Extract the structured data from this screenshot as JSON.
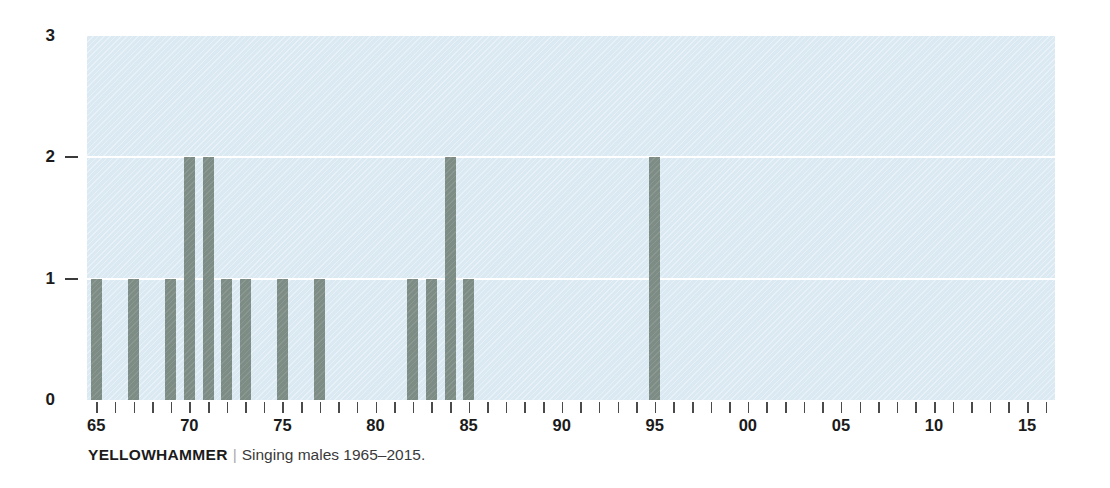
{
  "caption": {
    "species": "YELLOWHAMMER",
    "separator": "|",
    "description": "Singing males 1965–2015."
  },
  "colors": {
    "plot_background": "#dbeaf2",
    "bar": "#7d8c85",
    "gridline": "#ffffff",
    "axis_text": "#1b1b1b",
    "tick": "#4a4a4a",
    "caption_separator": "#a8a8a8"
  },
  "chart_data": {
    "type": "bar",
    "xlabel": "",
    "ylabel": "",
    "grid": true,
    "legend": null,
    "xlim": [
      1964.5,
      2016.5
    ],
    "ylim": [
      0,
      3
    ],
    "y_ticks": [
      0,
      1,
      2,
      3
    ],
    "y_tick_labels": [
      "0",
      "1",
      "2",
      "3"
    ],
    "x_ticks": [
      1965,
      1966,
      1967,
      1968,
      1969,
      1970,
      1971,
      1972,
      1973,
      1974,
      1975,
      1976,
      1977,
      1978,
      1979,
      1980,
      1981,
      1982,
      1983,
      1984,
      1985,
      1986,
      1987,
      1988,
      1989,
      1990,
      1991,
      1992,
      1993,
      1994,
      1995,
      1996,
      1997,
      1998,
      1999,
      2000,
      2001,
      2002,
      2003,
      2004,
      2005,
      2006,
      2007,
      2008,
      2009,
      2010,
      2011,
      2012,
      2013,
      2014,
      2015,
      2016
    ],
    "x_tick_labels": [
      {
        "year": 1965,
        "label": "65"
      },
      {
        "year": 1970,
        "label": "70"
      },
      {
        "year": 1975,
        "label": "75"
      },
      {
        "year": 1980,
        "label": "80"
      },
      {
        "year": 1985,
        "label": "85"
      },
      {
        "year": 1990,
        "label": "90"
      },
      {
        "year": 1995,
        "label": "95"
      },
      {
        "year": 2000,
        "label": "00"
      },
      {
        "year": 2005,
        "label": "05"
      },
      {
        "year": 2010,
        "label": "10"
      },
      {
        "year": 2015,
        "label": "15"
      }
    ],
    "categories": [
      1965,
      1967,
      1969,
      1970,
      1971,
      1972,
      1973,
      1975,
      1977,
      1982,
      1983,
      1984,
      1985,
      1995
    ],
    "values": [
      1,
      1,
      1,
      2,
      2,
      1,
      1,
      1,
      1,
      1,
      1,
      2,
      1,
      2
    ],
    "bars": [
      {
        "year": 1965,
        "value": 1
      },
      {
        "year": 1967,
        "value": 1
      },
      {
        "year": 1969,
        "value": 1
      },
      {
        "year": 1970,
        "value": 2
      },
      {
        "year": 1971,
        "value": 2
      },
      {
        "year": 1972,
        "value": 1
      },
      {
        "year": 1973,
        "value": 1
      },
      {
        "year": 1975,
        "value": 1
      },
      {
        "year": 1977,
        "value": 1
      },
      {
        "year": 1982,
        "value": 1
      },
      {
        "year": 1983,
        "value": 1
      },
      {
        "year": 1984,
        "value": 2
      },
      {
        "year": 1985,
        "value": 1
      },
      {
        "year": 1995,
        "value": 2
      }
    ]
  }
}
